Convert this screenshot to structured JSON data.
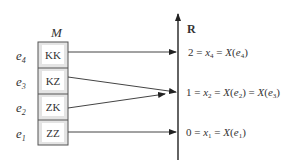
{
  "set_label": "M",
  "axis_label": "R",
  "elements": [
    {
      "name": "e",
      "sub": "4",
      "value": "KK"
    },
    {
      "name": "e",
      "sub": "3",
      "value": "KZ"
    },
    {
      "name": "e",
      "sub": "2",
      "value": "ZK"
    },
    {
      "name": "e",
      "sub": "1",
      "value": "ZZ"
    }
  ],
  "mappings": [
    {
      "from": "KK",
      "to": "2 = x4 = X(e4)"
    },
    {
      "from": "KZ",
      "to": "1 = x2 = X(e2) = X(e3)"
    },
    {
      "from": "ZK",
      "to": "1 = x2 = X(e2) = X(e3)"
    },
    {
      "from": "ZZ",
      "to": "0 = x1 = X(e1)"
    }
  ],
  "targets": [
    {
      "num": "2",
      "x": "x",
      "xsub": "4",
      "args": [
        {
          "e": "e",
          "sub": "4"
        }
      ]
    },
    {
      "num": "1",
      "x": "x",
      "xsub": "2",
      "args": [
        {
          "e": "e",
          "sub": "2"
        },
        {
          "e": "e",
          "sub": "3"
        }
      ]
    },
    {
      "num": "0",
      "x": "x",
      "xsub": "1",
      "args": [
        {
          "e": "e",
          "sub": "1"
        }
      ]
    }
  ],
  "colors": {
    "line": "#333333",
    "cell_fill": "#e4e4e4",
    "cell_inner": "#ffffff",
    "border": "#555555"
  }
}
